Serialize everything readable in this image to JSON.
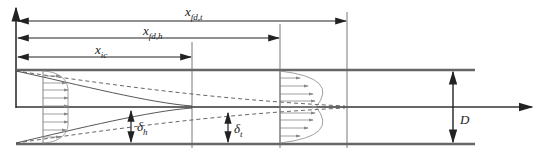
{
  "labels": {
    "x_fd_t": {
      "base": "x",
      "sub": "fd,t"
    },
    "x_fd_h": {
      "base": "x",
      "sub": "fd,h"
    },
    "x_ic": {
      "base": "x",
      "sub": "ic"
    },
    "delta_h": {
      "base": "δ",
      "sub": "h"
    },
    "delta_t": {
      "base": "δ",
      "sub": "t"
    },
    "D": {
      "base": "D",
      "sub": ""
    }
  },
  "colors": {
    "line": "#222222",
    "wall": "#666666",
    "profile": "#777777"
  }
}
